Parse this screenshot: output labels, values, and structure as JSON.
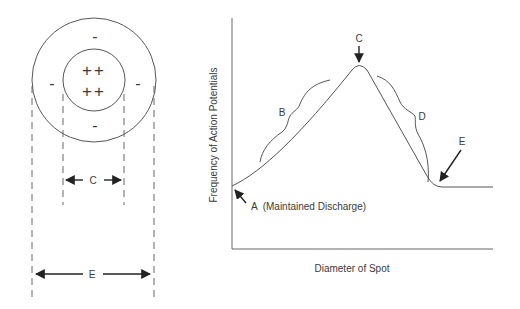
{
  "receptive_field": {
    "center_signs": [
      "++",
      "++"
    ],
    "surround_signs": {
      "top": "-",
      "left": "-",
      "right": "-",
      "bottom": "-"
    },
    "dimension_center_label": "C",
    "dimension_total_label": "E"
  },
  "graph": {
    "y_axis_label": "Frequency of Action Potentials",
    "x_axis_label": "Diameter of Spot",
    "annotations": {
      "A": "A  (Maintained Discharge)",
      "B": "B",
      "C": "C",
      "D": "D",
      "E": "E"
    }
  },
  "colors": {
    "line": "#555555",
    "text": "#3a3a3a",
    "background": "#ffffff"
  }
}
